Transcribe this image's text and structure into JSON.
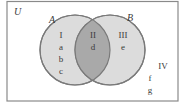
{
  "universe": {
    "label": "U"
  },
  "sets": [
    {
      "label": "A",
      "fill": "#dcdcdc",
      "stroke": "#7a7a7a"
    },
    {
      "label": "B",
      "fill": "#dcdcdc",
      "stroke": "#7a7a7a"
    }
  ],
  "intersection_fill": "#a9a9a9",
  "regions": {
    "I": {
      "label": "I",
      "elements": [
        "a",
        "b",
        "c"
      ]
    },
    "II": {
      "label": "II",
      "elements": [
        "d"
      ]
    },
    "III": {
      "label": "III",
      "elements": [
        "e"
      ]
    },
    "IV": {
      "label": "IV",
      "elements": [
        "f",
        "g"
      ]
    }
  },
  "colors": {
    "border": "#8a8a8a",
    "text": "#3a3a3a",
    "background": "#ffffff"
  }
}
